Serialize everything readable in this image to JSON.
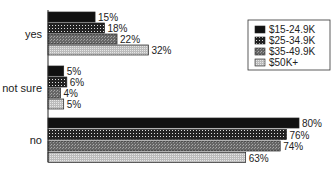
{
  "chart_data": {
    "type": "bar",
    "orientation": "horizontal",
    "title": "",
    "xlabel": "",
    "ylabel": "",
    "categories": [
      "yes",
      "not sure",
      "no"
    ],
    "series": [
      {
        "name": "$15-24.9K",
        "values": [
          15,
          5,
          80
        ]
      },
      {
        "name": "$25-34.9K",
        "values": [
          18,
          6,
          76
        ]
      },
      {
        "name": "$35-49.9K",
        "values": [
          22,
          4,
          74
        ]
      },
      {
        "name": "$50K+",
        "values": [
          32,
          5,
          63
        ]
      }
    ],
    "value_suffix": "%",
    "xlim": [
      0,
      80
    ],
    "grid": false,
    "legend_position": "top-right",
    "series_colors": [
      "#111111",
      "#3a3a3a",
      "#7a7a7a",
      "#c8c8c8"
    ]
  }
}
